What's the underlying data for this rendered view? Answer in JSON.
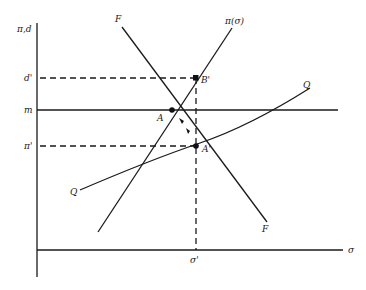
{
  "diagram": {
    "axes": {
      "y_label": "π,d",
      "x_label": "σ"
    },
    "levels": {
      "d_prime": "d'",
      "m": "m",
      "pi_prime": "π'",
      "sigma_prime": "σ'"
    },
    "curves": {
      "F_top": "F",
      "F_bottom": "F",
      "pi_sigma": "π(σ)",
      "Q_right": "Q",
      "Q_left": "Q"
    },
    "points": {
      "A": "A",
      "A_prime": "A'",
      "B_prime": "B'"
    }
  }
}
